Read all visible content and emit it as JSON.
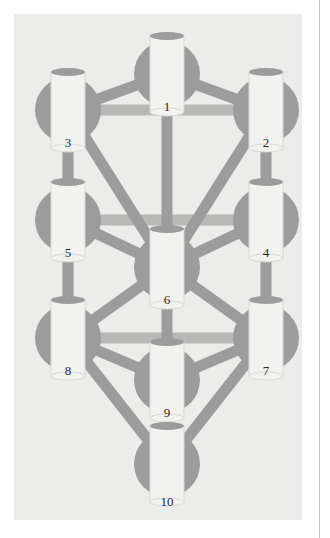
{
  "page": {
    "background_color": "#ffffff",
    "edge_rule_color": "#c9c9c9"
  },
  "panel": {
    "background_color": "#ececeb",
    "x": 14,
    "y": 14,
    "width": 288,
    "height": 506
  },
  "diagram": {
    "type": "node-link-diagram",
    "colors": {
      "node_circle": "#9c9c9c",
      "node_cylinder": "#f2f2f0",
      "node_cylinder_edge": "#d8d8d4",
      "edge_diagonal": "#9c9c9c",
      "edge_horizontal": "#b8b8b6",
      "label_text": "#2a2a2a"
    },
    "geometry": {
      "circle_radius": 33,
      "cylinder_width": 34,
      "cylinder_height": 76,
      "edge_thickness": 11,
      "horizontal_edge_thickness": 11
    },
    "nodes": [
      {
        "id": "1",
        "label": "1",
        "cx": 153,
        "cy": 60,
        "label_x": 153,
        "label_y": 86
      },
      {
        "id": "2",
        "label": "2",
        "cx": 252,
        "cy": 96,
        "label_x": 252,
        "label_y": 122
      },
      {
        "id": "3",
        "label": "3",
        "cx": 54,
        "cy": 96,
        "label_x": 54,
        "label_y": 122
      },
      {
        "id": "4",
        "label": "4",
        "cx": 252,
        "cy": 206,
        "label_x": 252,
        "label_y": 232
      },
      {
        "id": "5",
        "label": "5",
        "cx": 54,
        "cy": 206,
        "label_x": 54,
        "label_y": 232
      },
      {
        "id": "6",
        "label": "6",
        "cx": 153,
        "cy": 253,
        "label_x": 153,
        "label_y": 279
      },
      {
        "id": "7",
        "label": "7",
        "cx": 252,
        "cy": 324,
        "label_x": 252,
        "label_y": 350
      },
      {
        "id": "8",
        "label": "8",
        "cx": 54,
        "cy": 324,
        "label_x": 54,
        "label_y": 350
      },
      {
        "id": "9",
        "label": "9",
        "cx": 153,
        "cy": 366,
        "label_x": 153,
        "label_y": 392
      },
      {
        "id": "10",
        "label": "10",
        "cx": 153,
        "cy": 450,
        "label_x": 153,
        "label_y": 481
      }
    ],
    "edges": [
      {
        "from": "1",
        "to": "2",
        "style": "diagonal"
      },
      {
        "from": "1",
        "to": "3",
        "style": "diagonal"
      },
      {
        "from": "1",
        "to": "6",
        "style": "diagonal"
      },
      {
        "from": "3",
        "to": "2",
        "style": "horizontal"
      },
      {
        "from": "3",
        "to": "5",
        "style": "diagonal"
      },
      {
        "from": "2",
        "to": "4",
        "style": "diagonal"
      },
      {
        "from": "3",
        "to": "6",
        "style": "diagonal"
      },
      {
        "from": "2",
        "to": "6",
        "style": "diagonal"
      },
      {
        "from": "5",
        "to": "4",
        "style": "horizontal"
      },
      {
        "from": "5",
        "to": "6",
        "style": "diagonal"
      },
      {
        "from": "4",
        "to": "6",
        "style": "diagonal"
      },
      {
        "from": "5",
        "to": "8",
        "style": "diagonal"
      },
      {
        "from": "4",
        "to": "7",
        "style": "diagonal"
      },
      {
        "from": "8",
        "to": "7",
        "style": "horizontal"
      },
      {
        "from": "6",
        "to": "9",
        "style": "diagonal"
      },
      {
        "from": "8",
        "to": "6",
        "style": "diagonal"
      },
      {
        "from": "7",
        "to": "6",
        "style": "diagonal"
      },
      {
        "from": "8",
        "to": "9",
        "style": "diagonal"
      },
      {
        "from": "7",
        "to": "9",
        "style": "diagonal"
      },
      {
        "from": "8",
        "to": "10",
        "style": "diagonal"
      },
      {
        "from": "7",
        "to": "10",
        "style": "diagonal"
      },
      {
        "from": "9",
        "to": "10",
        "style": "diagonal"
      }
    ]
  }
}
